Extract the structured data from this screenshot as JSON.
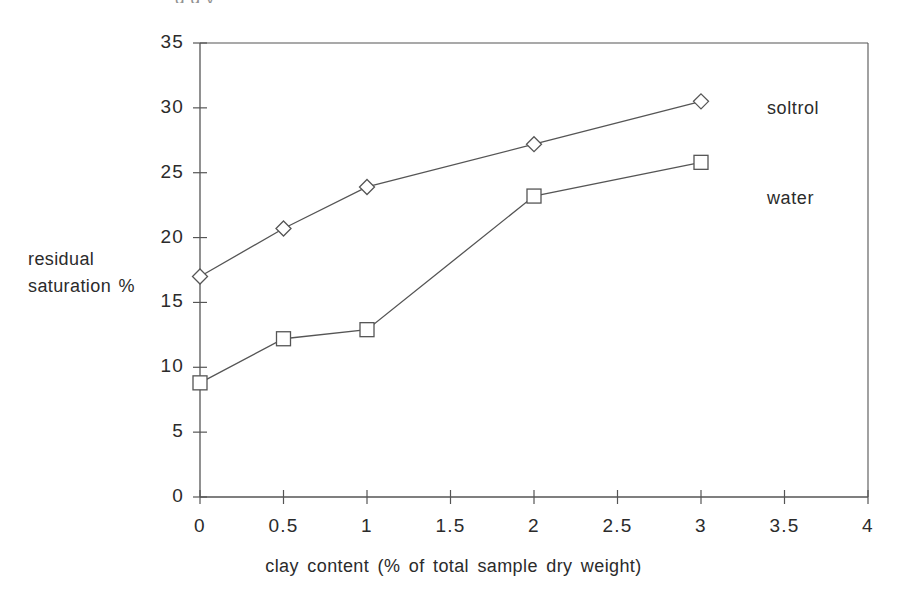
{
  "figure": {
    "cut_off_header_text": "g      g     y",
    "background_color": "#ffffff",
    "line_color": "#555555",
    "text_color": "#2b2b2b"
  },
  "chart_data": {
    "type": "line",
    "title": "",
    "xlabel": "clay content (% of total sample dry weight)",
    "ylabel": "residual saturation %",
    "ylabel_line1": "residual",
    "ylabel_line2": "saturation %",
    "xlim": [
      0,
      4
    ],
    "ylim": [
      0,
      35
    ],
    "xticks": [
      0,
      0.5,
      1,
      1.5,
      2,
      2.5,
      3,
      3.5,
      4
    ],
    "xtick_labels": [
      "0",
      "0.5",
      "1",
      "1.5",
      "2",
      "2.5",
      "3",
      "3.5",
      "4"
    ],
    "yticks": [
      0,
      5,
      10,
      15,
      20,
      25,
      30,
      35
    ],
    "ytick_labels": [
      "0",
      "5",
      "10",
      "15",
      "20",
      "25",
      "30",
      "35"
    ],
    "grid": false,
    "legend_position": "inline-right",
    "series": [
      {
        "name": "soltrol",
        "marker": "diamond",
        "color": "#555555",
        "x": [
          0,
          0.5,
          1,
          2,
          3
        ],
        "values": [
          17.0,
          20.7,
          23.9,
          27.2,
          30.5
        ]
      },
      {
        "name": "water",
        "marker": "square",
        "color": "#555555",
        "x": [
          0,
          0.5,
          1,
          2,
          3
        ],
        "values": [
          8.8,
          12.2,
          12.9,
          23.2,
          25.8
        ]
      }
    ]
  }
}
